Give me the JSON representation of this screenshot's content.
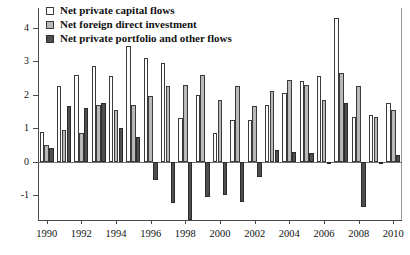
{
  "chart_data": {
    "type": "bar",
    "title": "",
    "subtitle": "",
    "xlabel": "",
    "ylabel": "",
    "grid": false,
    "legend_position": "top-left",
    "categories": [
      1990,
      1991,
      1992,
      1993,
      1994,
      1995,
      1996,
      1997,
      1998,
      1999,
      2000,
      2001,
      2002,
      2003,
      2004,
      2005,
      2006,
      2007,
      2008,
      2009,
      2010
    ],
    "tick_labels_x": [
      "1990",
      "1992",
      "1994",
      "1996",
      "1998",
      "2000",
      "2002",
      "2004",
      "2006",
      "2008",
      "2010"
    ],
    "tick_labels_y": [
      "4",
      "3",
      "2",
      "1",
      "0",
      "-1"
    ],
    "ylim": [
      -1.75,
      4.6
    ],
    "yticks": [
      4,
      3,
      2,
      1,
      0,
      -1
    ],
    "series": [
      {
        "name": "Net private capital flows",
        "color": "#fdfdfd",
        "values": [
          0.9,
          2.25,
          2.6,
          2.85,
          2.55,
          3.45,
          3.1,
          2.95,
          1.3,
          2.0,
          0.85,
          1.25,
          1.25,
          1.7,
          2.05,
          2.4,
          2.55,
          4.3,
          1.35,
          1.4,
          1.75
        ]
      },
      {
        "name": "Net foreign direct investment",
        "color": "#b9b9b9",
        "values": [
          0.5,
          0.95,
          0.85,
          1.7,
          1.55,
          1.7,
          1.95,
          2.25,
          2.3,
          2.6,
          1.85,
          2.25,
          1.65,
          2.1,
          2.45,
          2.3,
          1.85,
          2.65,
          2.25,
          1.35,
          1.55
        ]
      },
      {
        "name": "Net private portfolio and other flows",
        "color": "#4f4f4f",
        "values": [
          0.4,
          1.65,
          1.6,
          1.75,
          1.0,
          0.75,
          -0.55,
          -1.25,
          -1.75,
          -1.05,
          -1.0,
          -1.2,
          -0.45,
          0.35,
          0.3,
          0.25,
          -0.02,
          1.75,
          -1.35,
          -0.03,
          0.2
        ]
      }
    ]
  },
  "legend": {
    "items": [
      {
        "label": "Net private capital flows",
        "swatch": "#fdfdfd"
      },
      {
        "label": "Net foreign direct investment",
        "swatch": "#b9b9b9"
      },
      {
        "label": "Net private portfolio and other flows",
        "swatch": "#4f4f4f"
      }
    ]
  }
}
